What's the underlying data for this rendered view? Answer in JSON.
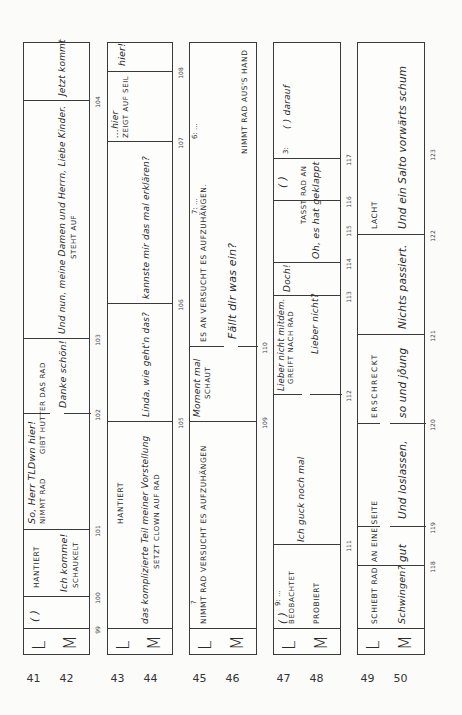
{
  "document": {
    "type": "transcript",
    "orientation": "rotated-90-ccw",
    "speakers": {
      "L": "L",
      "M": "M"
    }
  },
  "strips": [
    {
      "lines": [
        "41",
        "42"
      ],
      "timestamps": [
        "99",
        "100",
        "101",
        "102",
        "103",
        "104"
      ],
      "L": [
        "( )",
        "HANTIERT",
        "So, Herr TLDwn hier!",
        "NIMMT RAD",
        "GIBT HUTTER DAS RAD"
      ],
      "M": [
        "Ich komme!",
        "SCHAUKELT",
        "Danke schön!",
        "Und nun, meine Damen und Herrn, Liebe Kinder.",
        "STEHT AUF",
        "Jetzt kommt"
      ]
    },
    {
      "lines": [
        "43",
        "44"
      ],
      "timestamps": [
        "105",
        "106",
        "107",
        "108"
      ],
      "L": [
        "HANTIERT",
        "...hier",
        "ZEIGT AUF SEIL",
        "hier!"
      ],
      "M": [
        "das komplizierte Teil meiner Vorstellung",
        "SETZT CLOWN AUF RAD",
        "Linda, wie geht'n das?",
        "kannste mir das mal erklären?"
      ]
    },
    {
      "lines": [
        "45",
        "46"
      ],
      "timestamps": [
        "109",
        "110"
      ],
      "L": [
        "?",
        "NIMMT RAD VERSUCHT ES AUFZUHÄNGEN",
        "Moment mal",
        "SCHAUT",
        "ES AN VERSUCHT ES AUFZUHÄNGEN.",
        "7: ...",
        "6: ...",
        "NIMMT RAD AUS'S HAND"
      ],
      "M": [
        "Fällt dir was ein?"
      ]
    },
    {
      "lines": [
        "47",
        "48"
      ],
      "timestamps": [
        "111",
        "112",
        "113",
        "114",
        "115",
        "116",
        "117"
      ],
      "L": [
        "( )",
        "9: ...",
        "BEOBACHTET",
        "Lieber nicht mitdem.",
        "GREIFT NACH RAD",
        "Doch!",
        "( )",
        "RAD AN",
        "3:",
        "( ) darauf"
      ],
      "M": [
        "PROBIERT",
        "Ich guck noch mal",
        "Lieber nicht?",
        "Oh, es hat geklappt",
        "TASST"
      ]
    },
    {
      "lines": [
        "49",
        "50"
      ],
      "timestamps": [
        "118",
        "119",
        "120",
        "121",
        "122",
        "123"
      ],
      "L": [
        "SCHIEBT RAD",
        "AN EINE SEITE",
        "ERSCHRECKT",
        "LACHT"
      ],
      "M": [
        "Schwingen?",
        "gut",
        "Und loslassen,",
        "so und jo̊ung",
        "Nichts passiert.",
        "Und ein Salto vorwärts schum"
      ]
    }
  ]
}
